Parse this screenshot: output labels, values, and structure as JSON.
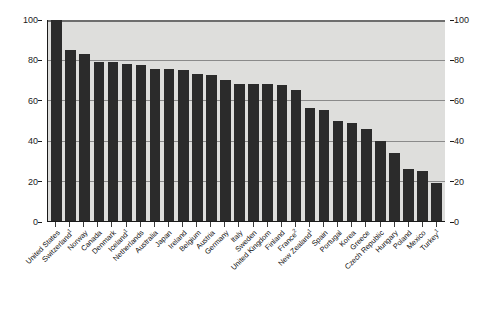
{
  "chart_data": {
    "type": "bar",
    "title": "",
    "subtitle": "",
    "xlabel": "",
    "ylabel": "",
    "ylim": [
      0,
      100
    ],
    "grid": true,
    "legend": "none",
    "y_ticks": [
      100,
      80,
      60,
      40,
      20,
      0
    ],
    "y_ticks_left": [
      "100",
      "80",
      "60",
      "40",
      "20",
      "0"
    ],
    "y_ticks_right": [
      "100",
      "80",
      "60",
      "40",
      "20",
      "0"
    ],
    "bar_color": "#2b2b2b",
    "plot_background": "#dededc",
    "categories": [
      "United States",
      "Switzerland 1",
      "Norway",
      "Canada",
      "Denmark",
      "Iceland 1",
      "Netherlands",
      "Australia",
      "Japan",
      "Ireland",
      "Belgium",
      "Austria",
      "Germany",
      "Italy",
      "Sweden",
      "United Kingdom",
      "Finland",
      "France 2",
      "New Zealand 1",
      "Spain",
      "Portugal",
      "Korea",
      "Greece",
      "Czech Republic",
      "Hungary",
      "Poland",
      "Mexico",
      "Turkey 1"
    ],
    "category_labels": [
      {
        "name": "United States",
        "footnote": ""
      },
      {
        "name": "Switzerland",
        "footnote": "1"
      },
      {
        "name": "Norway",
        "footnote": ""
      },
      {
        "name": "Canada",
        "footnote": ""
      },
      {
        "name": "Denmark",
        "footnote": ""
      },
      {
        "name": "Iceland",
        "footnote": "1"
      },
      {
        "name": "Netherlands",
        "footnote": ""
      },
      {
        "name": "Australia",
        "footnote": ""
      },
      {
        "name": "Japan",
        "footnote": ""
      },
      {
        "name": "Ireland",
        "footnote": ""
      },
      {
        "name": "Belgium",
        "footnote": ""
      },
      {
        "name": "Austria",
        "footnote": ""
      },
      {
        "name": "Germany",
        "footnote": ""
      },
      {
        "name": "Italy",
        "footnote": ""
      },
      {
        "name": "Sweden",
        "footnote": ""
      },
      {
        "name": "United Kingdom",
        "footnote": ""
      },
      {
        "name": "Finland",
        "footnote": ""
      },
      {
        "name": "France",
        "footnote": "2"
      },
      {
        "name": "New Zealand",
        "footnote": "1"
      },
      {
        "name": "Spain",
        "footnote": ""
      },
      {
        "name": "Portugal",
        "footnote": ""
      },
      {
        "name": "Korea",
        "footnote": ""
      },
      {
        "name": "Greece",
        "footnote": ""
      },
      {
        "name": "Czech Republic",
        "footnote": ""
      },
      {
        "name": "Hungary",
        "footnote": ""
      },
      {
        "name": "Poland",
        "footnote": ""
      },
      {
        "name": "Mexico",
        "footnote": ""
      },
      {
        "name": "Turkey",
        "footnote": "1"
      }
    ],
    "values": [
      100,
      85,
      83,
      79,
      79,
      78,
      77.5,
      75.5,
      75.5,
      75,
      73,
      72.5,
      70,
      68,
      68,
      68,
      67.5,
      65,
      56,
      55,
      50,
      49,
      46,
      40,
      34,
      26,
      25,
      19
    ]
  }
}
